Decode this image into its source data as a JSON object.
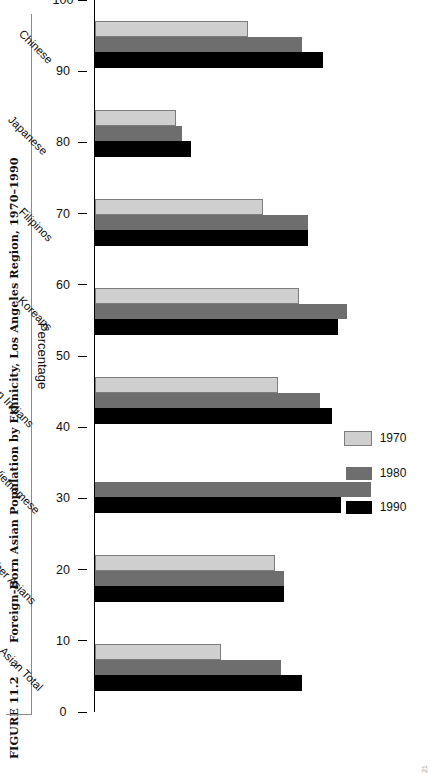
{
  "figure": {
    "number": "FIGURE 11.2",
    "separator": "|",
    "caption": "Foreign-Born Asian Population by Ethnicity, Los Angeles Region, 1970–1990",
    "page_mark": "21"
  },
  "legend": {
    "position": "inside-left",
    "entries": [
      {
        "label": "1970",
        "color": "#cfcfcf"
      },
      {
        "label": "1980",
        "color": "#6e6e6e"
      },
      {
        "label": "1990",
        "color": "#000000"
      }
    ]
  },
  "chart_data": {
    "type": "bar",
    "orientation": "horizontal",
    "title": "Foreign-Born Asian Population by Ethnicity, Los Angeles Region, 1970–1990",
    "xlabel": "",
    "ylabel": "Percentage",
    "ylim": [
      0,
      100
    ],
    "ytick_labels": [
      "0",
      "10",
      "20",
      "30",
      "40",
      "50",
      "60",
      "70",
      "80",
      "90",
      "100"
    ],
    "grid": false,
    "legend_position": "inside-left",
    "categories": [
      "Chinese",
      "Japanese",
      "Filipinos",
      "Koreans",
      "Asian Indians",
      "Vietnamese",
      "Other Asians",
      "Asian Total"
    ],
    "series": [
      {
        "name": "1970",
        "color": "#cfcfcf",
        "values": [
          51,
          27,
          56,
          68,
          61,
          null,
          60,
          42
        ]
      },
      {
        "name": "1980",
        "color": "#6e6e6e",
        "values": [
          69,
          29,
          71,
          84,
          75,
          92,
          63,
          62
        ]
      },
      {
        "name": "1990",
        "color": "#000000",
        "values": [
          76,
          32,
          71,
          81,
          79,
          82,
          63,
          69
        ]
      }
    ]
  }
}
